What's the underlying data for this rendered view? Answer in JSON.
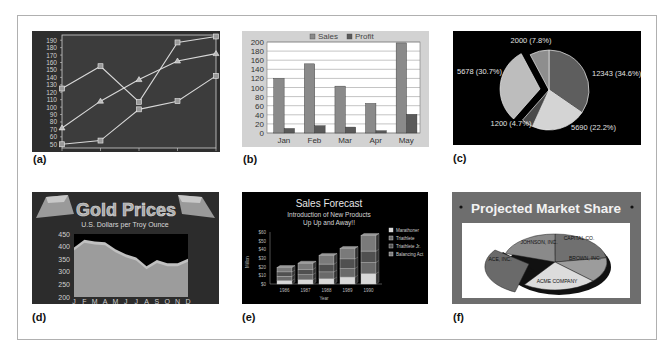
{
  "figure": {
    "captions": [
      "(a)",
      "(b)",
      "(c)",
      "(d)",
      "(e)",
      "(f)"
    ]
  },
  "chart_data": [
    {
      "id": "a",
      "type": "line",
      "title": "",
      "x": [
        1,
        2,
        3,
        4,
        5
      ],
      "yticks": [
        50,
        60,
        70,
        80,
        90,
        100,
        110,
        120,
        130,
        140,
        150,
        160,
        170,
        180,
        190
      ],
      "ylim": [
        45,
        197
      ],
      "grid": false,
      "background": "#3a3a3a",
      "series": [
        {
          "name": "Series 1",
          "marker": "square",
          "values": [
            125,
            155,
            107,
            187,
            195
          ]
        },
        {
          "name": "Series 2",
          "marker": "triangle",
          "values": [
            72,
            108,
            137,
            162,
            172
          ]
        },
        {
          "name": "Series 3",
          "marker": "square",
          "values": [
            50,
            55,
            97,
            108,
            142
          ]
        }
      ]
    },
    {
      "id": "b",
      "type": "bar",
      "title": "",
      "categories": [
        "Jan",
        "Feb",
        "Mar",
        "Apr",
        "May"
      ],
      "yticks": [
        0,
        20,
        40,
        60,
        80,
        100,
        120,
        140,
        160,
        180,
        200
      ],
      "ylim": [
        0,
        200
      ],
      "grid": true,
      "legend": {
        "position": "top",
        "entries": [
          "Sales",
          "Profit"
        ]
      },
      "series": [
        {
          "name": "Sales",
          "values": [
            120,
            152,
            103,
            65,
            198
          ],
          "color": "#8a8a8a"
        },
        {
          "name": "Profit",
          "values": [
            10,
            16,
            13,
            5,
            41
          ],
          "color": "#5a5a5a"
        }
      ]
    },
    {
      "id": "c",
      "type": "pie",
      "title": "",
      "background": "#000000",
      "slices": [
        {
          "label": "12343 (34.6%)",
          "value": 12343,
          "pct": 34.6,
          "color": "#5e5e5e"
        },
        {
          "label": "5690 (22.2%)",
          "value": 5690,
          "pct": 22.2,
          "color": "#d4d4d4"
        },
        {
          "label": "1200 (4.7%)",
          "value": 1200,
          "pct": 4.7,
          "color": "#4a4a4a"
        },
        {
          "label": "5678 (30.7%)",
          "value": 5678,
          "pct": 30.7,
          "color": "#bdbdbd",
          "exploded": true
        },
        {
          "label": "2000 (7.8%)",
          "value": 2000,
          "pct": 7.8,
          "color": "#8e8e8e"
        }
      ]
    },
    {
      "id": "d",
      "type": "area",
      "title": "Gold Prices",
      "subtitle": "U.S. Dollars per Troy Ounce",
      "categories": [
        "J",
        "F",
        "M",
        "A",
        "M",
        "J",
        "J",
        "A",
        "S",
        "O",
        "N",
        "D"
      ],
      "values": [
        385,
        415,
        408,
        405,
        378,
        358,
        345,
        310,
        335,
        322,
        322,
        340
      ],
      "yticks": [
        200,
        250,
        300,
        350,
        400,
        450
      ],
      "ylim": [
        200,
        450
      ]
    },
    {
      "id": "e",
      "type": "bar",
      "stacked": true,
      "title": "Sales Forecast",
      "subtitle_lines": [
        "Introduction of New Products",
        "Up Up and Away!!"
      ],
      "xlabel": "Year",
      "ylabel": "Millon",
      "categories": [
        "1986",
        "1987",
        "1988",
        "1989",
        "1990"
      ],
      "yticks": [
        "$0",
        "$10",
        "$20",
        "$30",
        "$40",
        "$50",
        "$60"
      ],
      "ylim": [
        0,
        60
      ],
      "legend": {
        "position": "right",
        "entries": [
          "Marathoner",
          "Triathlete",
          "Triathlete Jr.",
          "Balancing Act"
        ]
      },
      "series": [
        {
          "name": "Marathoner",
          "values": [
            4,
            5,
            6,
            8,
            12
          ],
          "color": "#d8d8d8"
        },
        {
          "name": "Triathlete",
          "values": [
            5,
            6,
            8,
            10,
            13
          ],
          "color": "#6a6a6a"
        },
        {
          "name": "Triathlete Jr.",
          "values": [
            5,
            6,
            9,
            11,
            13
          ],
          "color": "#505050"
        },
        {
          "name": "Balancing Act",
          "values": [
            5,
            7,
            10,
            12,
            18
          ],
          "color": "#7a7a7a"
        }
      ]
    },
    {
      "id": "f",
      "type": "pie",
      "title": "Projected Market Share",
      "slices": [
        {
          "label": "CAPITAL CO.",
          "color": "#707070"
        },
        {
          "label": "BROWN, INC.",
          "color": "#9c9c9c"
        },
        {
          "label": "ACME COMPANY",
          "color": "#dcdcdc"
        },
        {
          "label": "ACE, INC.",
          "color": "#6a6a6a",
          "exploded": true
        },
        {
          "label": "JOHNSON, INC.",
          "color": "#8a8a8a"
        }
      ]
    }
  ]
}
